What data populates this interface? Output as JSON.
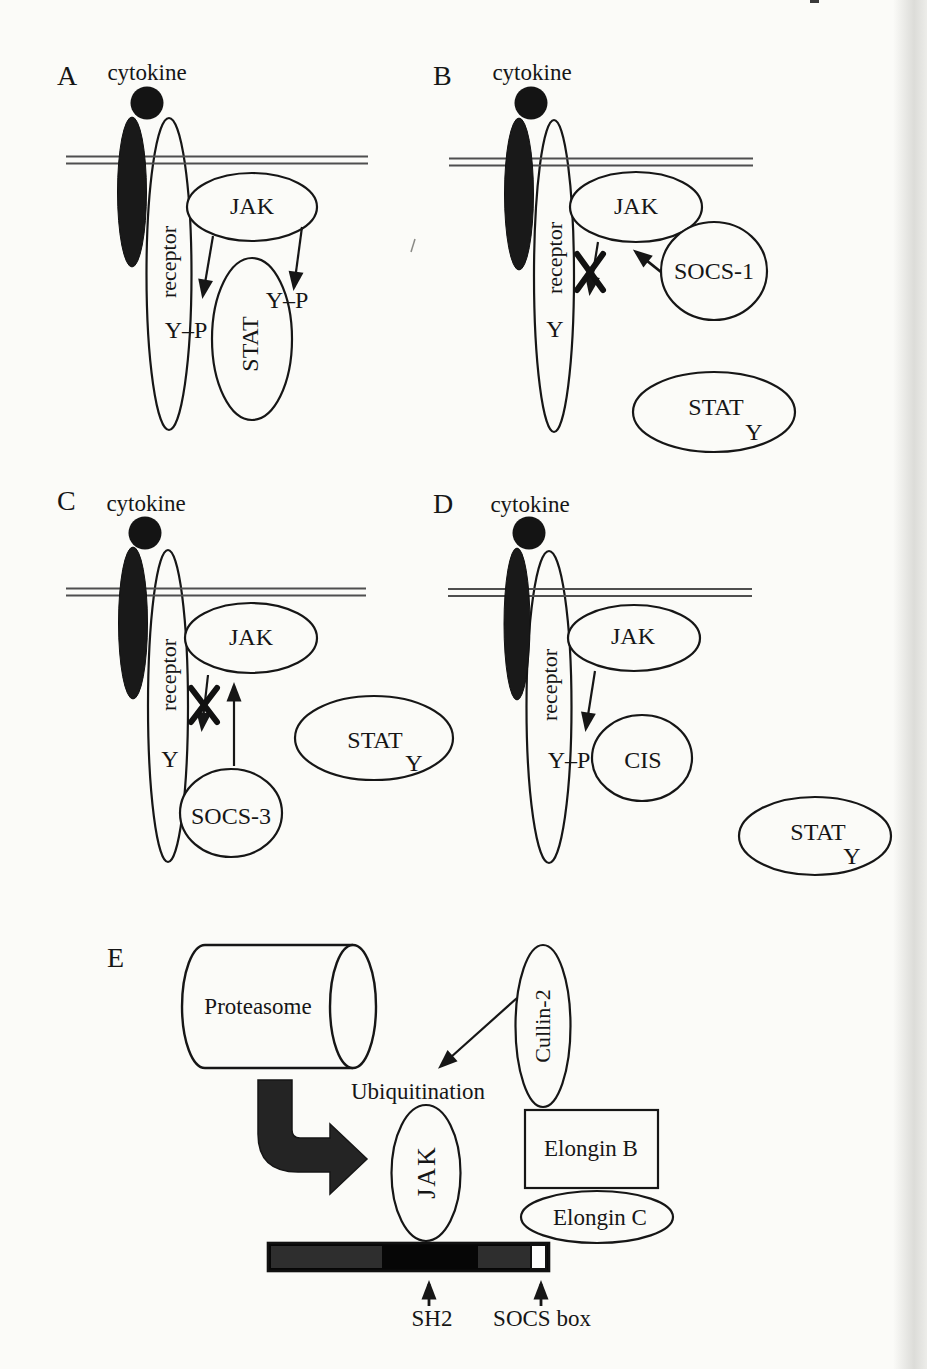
{
  "colors": {
    "paper": "#fbfbf8",
    "ink": "#161616",
    "membrane_gray": "#4f4f4f",
    "filled_black": "#191919",
    "bar_dark_gray": "#2e2e2e",
    "bar_black": "#060606",
    "socs_box_white": "#fdfdfc"
  },
  "panels": {
    "a": {
      "label": "A",
      "cytokine": "cytokine",
      "receptor": "receptor",
      "jak": "JAK",
      "stat": "STAT",
      "receptor_site": "Y–P",
      "stat_site": "Y–P"
    },
    "b": {
      "label": "B",
      "cytokine": "cytokine",
      "receptor": "receptor",
      "jak": "JAK",
      "socs1": "SOCS-1",
      "stat": "STAT",
      "receptor_site": "Y",
      "stat_site": "Y"
    },
    "c": {
      "label": "C",
      "cytokine": "cytokine",
      "receptor": "receptor",
      "jak": "JAK",
      "socs3": "SOCS-3",
      "stat": "STAT",
      "receptor_site": "Y",
      "stat_site": "Y"
    },
    "d": {
      "label": "D",
      "cytokine": "cytokine",
      "receptor": "receptor",
      "jak": "JAK",
      "cis": "CIS",
      "stat": "STAT",
      "receptor_site": "Y–P",
      "stat_site": "Y"
    },
    "e": {
      "label": "E",
      "proteasome": "Proteasome",
      "ubiquitination": "Ubiquitination",
      "jak": "JAK",
      "cullin2": "Cullin-2",
      "elongin_b": "Elongin B",
      "elongin_c": "Elongin C",
      "sh2": "SH2",
      "socs_box": "SOCS box"
    }
  }
}
